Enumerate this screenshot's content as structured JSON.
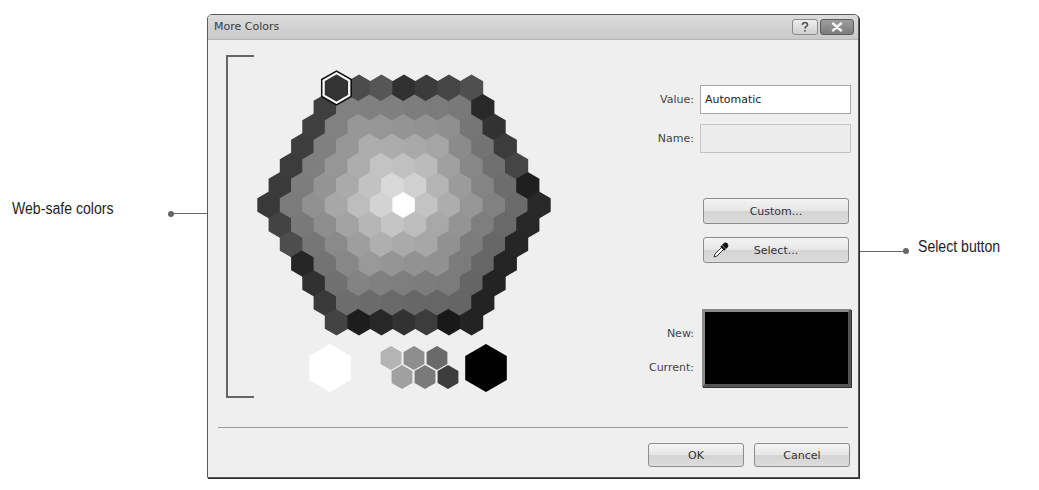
{
  "dialog": {
    "title": "More Colors",
    "help_button": "?",
    "close_button": "X"
  },
  "palette": {
    "label": "Web-safe colors",
    "selected_index": 0,
    "grayscale_row": [
      "white",
      "light-gray",
      "gray",
      "dark-gray",
      "darker-gray",
      "darkest-gray",
      "black"
    ]
  },
  "fields": {
    "value_label": "Value:",
    "value": "Automatic",
    "name_label": "Name:",
    "name": ""
  },
  "buttons": {
    "custom": "Custom...",
    "select": "Select...",
    "ok": "OK",
    "cancel": "Cancel"
  },
  "preview": {
    "new_label": "New:",
    "current_label": "Current:",
    "new_color": "#000000",
    "current_color": "#000000"
  },
  "callouts": {
    "left": "Web-safe colors",
    "right": "Select button"
  },
  "icons": {
    "eyedropper": "eyedropper-icon",
    "help": "question-mark-icon",
    "close": "close-x-icon"
  }
}
